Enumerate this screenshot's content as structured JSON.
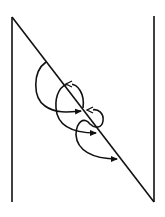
{
  "diagram": {
    "stroke_color": "#111111",
    "background": "#ffffff",
    "lines": {
      "left_vertical": {
        "x": 12,
        "y1": 17,
        "y2": 202
      },
      "right_vertical": {
        "x": 154,
        "y1": 16,
        "y2": 202
      },
      "diagonal": {
        "x1": 12,
        "y1": 17,
        "x2": 154,
        "y2": 202
      }
    },
    "arrows": [
      {
        "id": "arc-1",
        "head": "filled"
      },
      {
        "id": "loop-2",
        "head": "open-and-filled"
      },
      {
        "id": "loop-3",
        "head": "open-and-filled"
      }
    ]
  }
}
